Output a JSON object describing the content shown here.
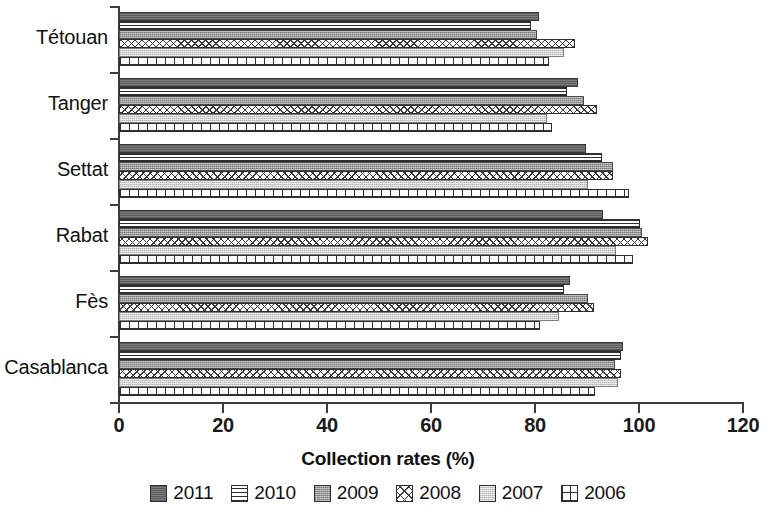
{
  "chart_data": {
    "type": "bar",
    "orientation": "horizontal",
    "title": "",
    "xlabel": "Collection rates (%)",
    "ylabel": "",
    "xlim": [
      0,
      120
    ],
    "xticks": [
      0,
      20,
      40,
      60,
      80,
      100,
      120
    ],
    "grid": false,
    "legend_position": "bottom",
    "categories": [
      "Tétouan",
      "Tanger",
      "Settat",
      "Rabat",
      "Fès",
      "Casablanca"
    ],
    "series": [
      {
        "name": "2011",
        "values": [
          80.8,
          88.3,
          89.8,
          93.1,
          86.7,
          96.9
        ]
      },
      {
        "name": "2010",
        "values": [
          79.2,
          86.2,
          92.9,
          100.2,
          85.6,
          96.5
        ]
      },
      {
        "name": "2009",
        "values": [
          80.4,
          89.4,
          95.0,
          100.6,
          90.2,
          95.4
        ]
      },
      {
        "name": "2008",
        "values": [
          87.7,
          91.9,
          95.0,
          101.7,
          91.3,
          96.5
        ]
      },
      {
        "name": "2007",
        "values": [
          85.6,
          82.3,
          90.2,
          95.6,
          84.6,
          96.0
        ]
      },
      {
        "name": "2006",
        "values": [
          82.7,
          83.3,
          98.1,
          98.8,
          81.0,
          91.5
        ]
      }
    ]
  },
  "axis": {
    "x_tick_labels": [
      "0",
      "20",
      "40",
      "60",
      "80",
      "100",
      "120"
    ],
    "x_title": "Collection rates (%)"
  },
  "categories": [
    {
      "label": "Tétouan"
    },
    {
      "label": "Tanger"
    },
    {
      "label": "Settat"
    },
    {
      "label": "Rabat"
    },
    {
      "label": "Fès"
    },
    {
      "label": "Casablanca"
    }
  ],
  "legend": {
    "items": [
      {
        "label": "2011",
        "pattern": "solid-dark-grey",
        "color": "#706f6f"
      },
      {
        "label": "2010",
        "pattern": "horizontal-lines",
        "color": "#ffffff"
      },
      {
        "label": "2009",
        "pattern": "speckled-medium-grey",
        "color": "#9b9a9a"
      },
      {
        "label": "2008",
        "pattern": "diamond-crosshatch",
        "color": "#ffffff"
      },
      {
        "label": "2007",
        "pattern": "light-grey-speckle",
        "color": "#d0cfcf"
      },
      {
        "label": "2006",
        "pattern": "square-grid",
        "color": "#ffffff"
      }
    ]
  }
}
